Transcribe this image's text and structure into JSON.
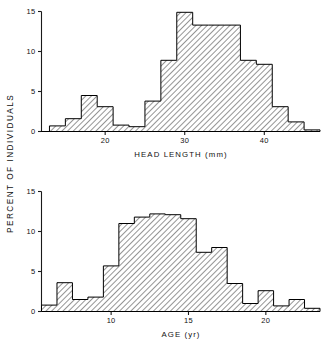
{
  "figure": {
    "ylabel": "PERCENT  OF  INDIVIDUALS",
    "background_color": "#ffffff",
    "ink_color": "#000000"
  },
  "chart_data": [
    {
      "type": "bar",
      "id": "head-length-histogram",
      "title": "",
      "xlabel": "HEAD  LENGTH  (mm)",
      "ylabel": "PERCENT OF INDIVIDUALS",
      "xlim": [
        12.0,
        47.0
      ],
      "ylim": [
        0,
        15
      ],
      "xticks": [
        20,
        30,
        40
      ],
      "xticklabels": [
        "20",
        "30",
        "40"
      ],
      "yticks": [
        0,
        5,
        10,
        15
      ],
      "yticklabels": [
        "0",
        "5",
        "10",
        "15"
      ],
      "grid": false,
      "legend": null,
      "bin_width": 2.0,
      "bin_edges": [
        13,
        15,
        17,
        19,
        21,
        23,
        25,
        27,
        29,
        31,
        33,
        35,
        37,
        39,
        41,
        43,
        45,
        47
      ],
      "bin_centers": [
        14,
        16,
        18,
        20,
        22,
        24,
        26,
        28,
        30,
        32,
        34,
        36,
        38,
        40,
        42,
        44,
        46
      ],
      "values": [
        0.7,
        1.6,
        4.5,
        3.1,
        0.8,
        0.6,
        3.8,
        8.9,
        14.9,
        13.3,
        13.3,
        13.3,
        8.9,
        8.4,
        3.1,
        1.2,
        0.2
      ],
      "fill": "diagonal-hatch"
    },
    {
      "type": "bar",
      "id": "age-histogram",
      "title": "",
      "xlabel": "AGE  (yr)",
      "ylabel": "PERCENT OF INDIVIDUALS",
      "xlim": [
        5.5,
        23.5
      ],
      "ylim": [
        0,
        15
      ],
      "xticks": [
        10,
        15,
        20
      ],
      "xticklabels": [
        "10",
        "15",
        "20"
      ],
      "yticks": [
        0,
        5,
        10,
        15
      ],
      "yticklabels": [
        "0",
        "5",
        "10",
        "15"
      ],
      "grid": false,
      "legend": null,
      "bin_width": 1.0,
      "bin_edges": [
        5.5,
        6.5,
        7.5,
        8.5,
        9.5,
        10.5,
        11.5,
        12.5,
        13.5,
        14.5,
        15.5,
        16.5,
        17.5,
        18.5,
        19.5,
        20.5,
        21.5,
        22.5,
        23.5
      ],
      "bin_centers": [
        6,
        7,
        8,
        9,
        10,
        11,
        12,
        13,
        14,
        15,
        16,
        17,
        18,
        19,
        20,
        21,
        22,
        23
      ],
      "values": [
        0.8,
        3.6,
        1.5,
        1.8,
        5.7,
        11.0,
        11.8,
        12.2,
        12.1,
        11.6,
        7.4,
        8.0,
        3.5,
        1.0,
        2.6,
        0.7,
        1.5,
        0.4
      ],
      "fill": "diagonal-hatch"
    }
  ]
}
